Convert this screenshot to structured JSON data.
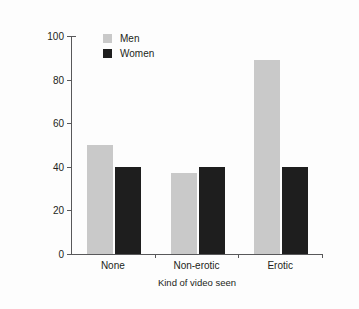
{
  "chart_data": {
    "type": "bar",
    "title": "",
    "xlabel": "Kind of video seen",
    "ylabel": "Percentage helping",
    "categories": [
      "None",
      "Non-erotic",
      "Erotic"
    ],
    "series": [
      {
        "name": "Men",
        "color": "#c9c9c9",
        "values": [
          50,
          37,
          89
        ]
      },
      {
        "name": "Women",
        "color": "#1e1e1e",
        "values": [
          40,
          40,
          40
        ]
      }
    ],
    "ylim": [
      0,
      100
    ],
    "yticks": [
      0,
      20,
      40,
      60,
      80,
      100
    ],
    "ytick_labels": [
      "0",
      "20",
      "40",
      "60",
      "80",
      "100"
    ],
    "grid": false,
    "legend_position": "top-left-inside"
  },
  "legend": {
    "items": [
      {
        "label": "Men",
        "swatch": "men"
      },
      {
        "label": "Women",
        "swatch": "women"
      }
    ]
  }
}
